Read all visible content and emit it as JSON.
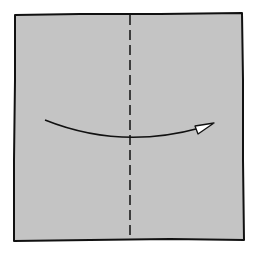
{
  "diagram": {
    "type": "origami-fold-step",
    "background": "#ffffff",
    "paper": {
      "shape": "square",
      "fill": "#c4c4c4",
      "stroke": "#111111"
    },
    "fold_line": {
      "kind": "valley-fold",
      "orientation": "vertical",
      "style": "dashed",
      "color": "#111111"
    },
    "arrow": {
      "direction": "left-to-right",
      "meaning": "fold left half over to the right",
      "color": "#111111",
      "head_fill": "#ffffff"
    }
  }
}
